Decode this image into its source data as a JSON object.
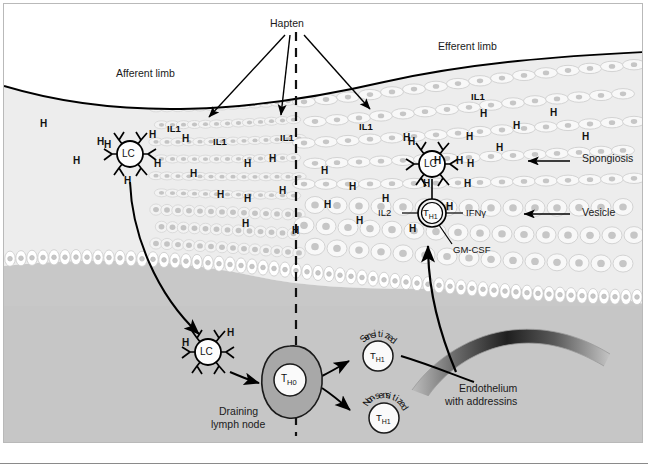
{
  "figure": {
    "title_labels": {
      "hapten": "Hapten",
      "afferent": "Afferent limb",
      "efferent": "Efferent limb"
    },
    "annotations": [
      {
        "name": "spongiosis",
        "text": "Spongiosis"
      },
      {
        "name": "vesicle",
        "text": "Vesicle"
      },
      {
        "name": "endothelium",
        "line1": "Endothelium",
        "line2": "with addressins"
      },
      {
        "name": "lymph-node",
        "line1": "Draining",
        "line2": "lymph node"
      }
    ],
    "cells": {
      "langerhans_epidermal": "LC",
      "langerhans_dermal": "LC",
      "langerhans_efferent": "LC",
      "th0": "T",
      "th0_sub": "H0",
      "th1_effector": "T",
      "th1_effector_sub": "H1",
      "th1_sensitized": "T",
      "th1_sensitized_sub": "H1",
      "th1_nonsensitized": "T",
      "th1_nonsensitized_sub": "H1"
    },
    "arc_labels": {
      "sensitized": "Sensitized",
      "nonsensitized": "Non-sensitized"
    },
    "cytokines": {
      "il2": "IL2",
      "ifng": "IFNγ",
      "gmcsf": "GM-CSF"
    },
    "il1_labels": [
      {
        "id": "il1-a",
        "text": "IL1"
      },
      {
        "id": "il1-b",
        "text": "IL1"
      },
      {
        "id": "il1-c",
        "text": "IL1"
      },
      {
        "id": "il1-d",
        "text": "IL1"
      },
      {
        "id": "il1-e",
        "text": "IL1"
      }
    ],
    "hapten_marks": [
      {
        "id": "h-01",
        "text": "H",
        "x": 36,
        "y": 115
      },
      {
        "id": "h-02",
        "text": "H",
        "x": 93,
        "y": 133
      },
      {
        "id": "h-03",
        "text": "H",
        "x": 178,
        "y": 130
      },
      {
        "id": "h-04",
        "text": "H",
        "x": 69,
        "y": 152
      },
      {
        "id": "h-05",
        "text": "H",
        "x": 150,
        "y": 155
      },
      {
        "id": "h-06",
        "text": "H",
        "x": 186,
        "y": 165
      },
      {
        "id": "h-07",
        "text": "H",
        "x": 120,
        "y": 172
      },
      {
        "id": "h-08",
        "text": "H",
        "x": 240,
        "y": 155
      },
      {
        "id": "h-09",
        "text": "H",
        "x": 265,
        "y": 150
      },
      {
        "id": "h-10",
        "text": "H",
        "x": 213,
        "y": 186
      },
      {
        "id": "h-11",
        "text": "H",
        "x": 240,
        "y": 190
      },
      {
        "id": "h-12",
        "text": "H",
        "x": 275,
        "y": 182
      },
      {
        "id": "h-13",
        "text": "H",
        "x": 317,
        "y": 162
      },
      {
        "id": "h-14",
        "text": "H",
        "x": 320,
        "y": 196
      },
      {
        "id": "h-15",
        "text": "H",
        "x": 345,
        "y": 178
      },
      {
        "id": "h-16",
        "text": "H",
        "x": 378,
        "y": 190
      },
      {
        "id": "h-17",
        "text": "H",
        "x": 238,
        "y": 215
      },
      {
        "id": "h-18",
        "text": "H",
        "x": 288,
        "y": 222
      },
      {
        "id": "h-19",
        "text": "H",
        "x": 352,
        "y": 212
      },
      {
        "id": "h-20",
        "text": "H",
        "x": 399,
        "y": 129
      },
      {
        "id": "h-21",
        "text": "H",
        "x": 430,
        "y": 152
      },
      {
        "id": "h-22",
        "text": "H",
        "x": 405,
        "y": 220
      },
      {
        "id": "h-23",
        "text": "H",
        "x": 476,
        "y": 105
      },
      {
        "id": "h-24",
        "text": "H",
        "x": 509,
        "y": 117
      },
      {
        "id": "h-25",
        "text": "H",
        "x": 546,
        "y": 104
      },
      {
        "id": "h-26",
        "text": "H",
        "x": 578,
        "y": 128
      },
      {
        "id": "h-27",
        "text": "H",
        "x": 492,
        "y": 139
      },
      {
        "id": "h-28",
        "text": "H",
        "x": 460,
        "y": 175
      },
      {
        "id": "h-29",
        "text": "H",
        "x": 442,
        "y": 198
      },
      {
        "id": "h-30",
        "text": "H",
        "x": 462,
        "y": 128
      },
      {
        "id": "h-31",
        "text": "H",
        "x": 419,
        "y": 175
      },
      {
        "id": "h-32",
        "text": "H",
        "x": 463,
        "y": 155
      }
    ],
    "lc_hapten_marks": {
      "epidermal": [
        "H",
        "H"
      ],
      "dermal": [
        "H",
        "H"
      ],
      "efferent": [
        "H",
        "H",
        "H"
      ]
    },
    "colors": {
      "skin_surface_line": "#000000",
      "epidermis": "#ededed",
      "dermis_upper": "#cfcfcf",
      "dermis_lower": "#c6c6c6",
      "lymph_node_fill": "#a8a8a8",
      "cell_fill": "#ffffff",
      "cell_nucleus": "#c2c2c2",
      "endothelium_dark": "#2b2b2b",
      "outline": "#111111",
      "dashed_line": "#111111"
    }
  }
}
